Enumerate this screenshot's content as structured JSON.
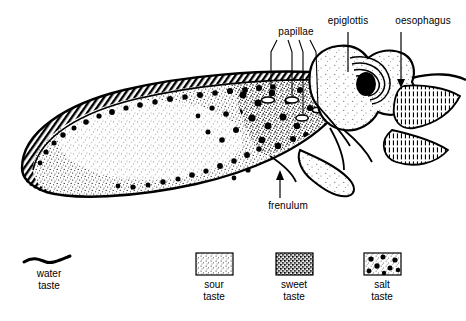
{
  "figure": {
    "width": 466,
    "height": 321,
    "background": "#ffffff",
    "ink": "#000000"
  },
  "callouts": [
    {
      "id": "papillae",
      "label": "papillae",
      "label_x": 296,
      "label_y": 32,
      "leader": "four-line-fan",
      "pointer": "none"
    },
    {
      "id": "epiglottis",
      "label": "epiglottis",
      "label_x": 348,
      "label_y": 21,
      "leader": "vertical-line",
      "pointer": "none"
    },
    {
      "id": "oesophagus",
      "label": "oesophagus",
      "label_x": 423,
      "label_y": 21,
      "leader": "vertical-line",
      "pointer": "arrow-down"
    },
    {
      "id": "frenulum",
      "label": "frenulum",
      "label_x": 288,
      "label_y": 206,
      "leader": "vertical-line",
      "pointer": "arrow-up"
    }
  ],
  "legend": {
    "items": [
      {
        "id": "water",
        "name_line1": "water",
        "name_line2": "taste",
        "swatch": "wavy-brace",
        "swatch_x": 49,
        "swatch_y": 258,
        "caption_x": 49,
        "caption_y": 268,
        "fill_hint": "#000000"
      },
      {
        "id": "sour",
        "name_line1": "sour",
        "name_line2": "taste",
        "swatch": "light-stipple-box",
        "swatch_x": 196,
        "swatch_y": 253,
        "caption_x": 214,
        "caption_y": 281,
        "fill_hint": "#d8d8d8"
      },
      {
        "id": "sweet",
        "name_line1": "sweet",
        "name_line2": "taste",
        "swatch": "dark-stipple-box",
        "swatch_x": 276,
        "swatch_y": 253,
        "caption_x": 294,
        "caption_y": 281,
        "fill_hint": "#555555"
      },
      {
        "id": "salt",
        "name_line1": "salt",
        "name_line2": "taste",
        "swatch": "dotted-stipple-box",
        "swatch_x": 364,
        "swatch_y": 253,
        "caption_x": 382,
        "caption_y": 281,
        "fill_hint": "#cccccc"
      }
    ],
    "swatch_width": 37,
    "swatch_height": 22
  },
  "anatomy": {
    "regions": [
      {
        "id": "tongue-body",
        "label": "tongue dorsum",
        "texture": "medium-stipple"
      },
      {
        "id": "tongue-rim",
        "label": "tongue margin",
        "texture": "dark-hatch"
      },
      {
        "id": "salt-zone",
        "label": "salt taste zone",
        "texture": "stipple-with-large-dots"
      },
      {
        "id": "pharynx",
        "label": "pharyngeal wall",
        "texture": "swirl-hatch"
      },
      {
        "id": "posterior-hatch",
        "label": "posterior pharynx",
        "texture": "vertical-hatch"
      }
    ]
  }
}
